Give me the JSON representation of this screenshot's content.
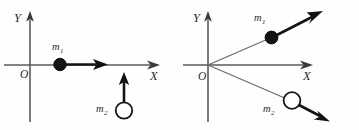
{
  "figure": {
    "background_color": "#fefefe",
    "ink_color": "#141414",
    "axis_color": "#5a5a5a"
  },
  "panels": [
    {
      "id": "left",
      "name": "before-collision",
      "axes": {
        "x_label": "X",
        "y_label": "Y",
        "origin_label": "O"
      },
      "bodies": [
        {
          "label": "m",
          "subscript": "1",
          "style": "filled",
          "position": "on-x-axis",
          "vector_direction": "right"
        },
        {
          "label": "m",
          "subscript": "2",
          "style": "open",
          "position": "below-x-axis",
          "vector_direction": "up"
        }
      ]
    },
    {
      "id": "right",
      "name": "after-collision",
      "axes": {
        "x_label": "X",
        "y_label": "Y",
        "origin_label": "O"
      },
      "bodies": [
        {
          "label": "m",
          "subscript": "1",
          "style": "filled",
          "position": "upper-right-ray",
          "vector_direction": "up-right"
        },
        {
          "label": "m",
          "subscript": "2",
          "style": "open",
          "position": "lower-right-ray",
          "vector_direction": "down-right"
        }
      ]
    }
  ]
}
